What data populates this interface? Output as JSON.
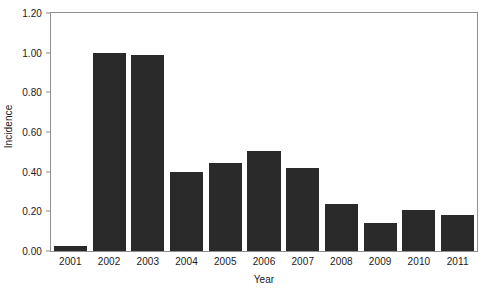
{
  "chart_data": {
    "type": "bar",
    "title": "",
    "xlabel": "Year",
    "ylabel": "Incidence",
    "categories": [
      "2001",
      "2002",
      "2003",
      "2004",
      "2005",
      "2006",
      "2007",
      "2008",
      "2009",
      "2010",
      "2011"
    ],
    "values": [
      0.025,
      1.0,
      0.99,
      0.4,
      0.445,
      0.505,
      0.42,
      0.235,
      0.14,
      0.205,
      0.18
    ],
    "ylim": [
      0.0,
      1.2
    ],
    "ytick_values": [
      0.0,
      0.2,
      0.4,
      0.6,
      0.8,
      1.0,
      1.2
    ],
    "ytick_labels": [
      "0.00",
      "0.20",
      "0.40",
      "0.60",
      "0.80",
      "1.00",
      "1.20"
    ],
    "grid": false,
    "legend": null,
    "legend_position": "none",
    "series": [
      {
        "name": "Incidence",
        "values": [
          0.025,
          1.0,
          0.99,
          0.4,
          0.445,
          0.505,
          0.42,
          0.235,
          0.14,
          0.205,
          0.18
        ]
      }
    ],
    "colors": {
      "bar_fill": "#2a2a2a",
      "axis_line": "#8f8f8f",
      "text": "#1a1a1a",
      "background": "#ffffff"
    }
  }
}
